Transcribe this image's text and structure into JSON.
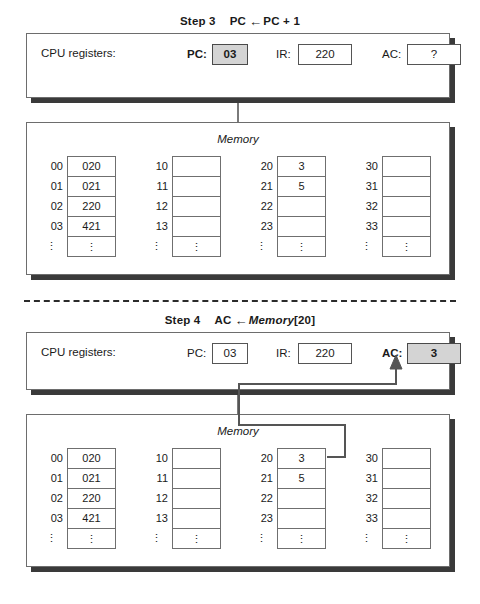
{
  "colors": {
    "highlight_fill": "#d4d4d4",
    "panel_border": "#6d6d6d",
    "shadow": "#3a3a3a",
    "flow_line": "#555555",
    "text": "#1a1a1a"
  },
  "steps": [
    {
      "id": "step3",
      "step_label": "Step 3",
      "operation_prefix": "PC",
      "operation_arrow": "←",
      "operation_suffix": "PC + 1",
      "operation_full": "Step 3    PC ← PC + 1",
      "registers": {
        "caption": "CPU registers:",
        "items": [
          {
            "name": "PC:",
            "value": "03",
            "highlighted": true
          },
          {
            "name": "IR:",
            "value": "220",
            "highlighted": false
          },
          {
            "name": "AC:",
            "value": "?",
            "highlighted": false
          }
        ]
      },
      "memory": {
        "title": "Memory",
        "ellipsis": "⋮",
        "columns": [
          {
            "addresses": [
              "00",
              "01",
              "02",
              "03"
            ],
            "values": [
              "020",
              "021",
              "220",
              "421"
            ]
          },
          {
            "addresses": [
              "10",
              "11",
              "12",
              "13"
            ],
            "values": [
              "",
              "",
              "",
              ""
            ]
          },
          {
            "addresses": [
              "20",
              "21",
              "22",
              "23"
            ],
            "values": [
              "3",
              "5",
              "",
              ""
            ]
          },
          {
            "addresses": [
              "30",
              "31",
              "32",
              "33"
            ],
            "values": [
              "",
              "",
              "",
              ""
            ]
          }
        ]
      },
      "has_data_flow": false
    },
    {
      "id": "step4",
      "step_label": "Step 4",
      "operation_prefix": "AC",
      "operation_arrow": "←",
      "operation_suffix_italic": "Memory",
      "operation_suffix_plain": "[20]",
      "operation_full": "Step 4    AC ← Memory[20]",
      "registers": {
        "caption": "CPU registers:",
        "items": [
          {
            "name": "PC:",
            "value": "03",
            "highlighted": false
          },
          {
            "name": "IR:",
            "value": "220",
            "highlighted": false
          },
          {
            "name": "AC:",
            "value": "3",
            "highlighted": true
          }
        ]
      },
      "memory": {
        "title": "Memory",
        "ellipsis": "⋮",
        "columns": [
          {
            "addresses": [
              "00",
              "01",
              "02",
              "03"
            ],
            "values": [
              "020",
              "021",
              "220",
              "421"
            ]
          },
          {
            "addresses": [
              "10",
              "11",
              "12",
              "13"
            ],
            "values": [
              "",
              "",
              "",
              ""
            ]
          },
          {
            "addresses": [
              "20",
              "21",
              "22",
              "23"
            ],
            "values": [
              "3",
              "5",
              "",
              ""
            ]
          },
          {
            "addresses": [
              "30",
              "31",
              "32",
              "33"
            ],
            "values": [
              "",
              "",
              "",
              ""
            ]
          }
        ]
      },
      "has_data_flow": true,
      "data_flow_source": "memory[20]",
      "data_flow_target": "AC"
    }
  ]
}
